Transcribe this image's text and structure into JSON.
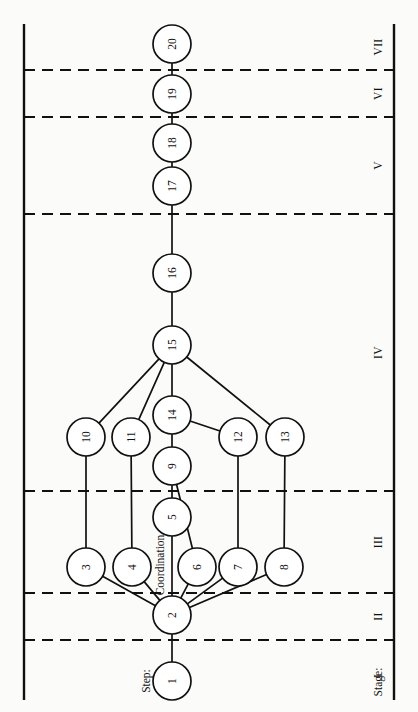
{
  "figure": {
    "orientation": "rotated-90-ccw",
    "background_color": "#fbfbf9",
    "ink_color": "#111111"
  },
  "axes": {
    "step_caption": "Step:",
    "stage_caption": "Stage:"
  },
  "stages": [
    {
      "id": "I",
      "label": "I",
      "band_start": 640,
      "band_end": 712
    },
    {
      "id": "II",
      "label": "II",
      "band_start": 593,
      "band_end": 640
    },
    {
      "id": "III",
      "label": "III",
      "band_start": 491,
      "band_end": 593
    },
    {
      "id": "IV",
      "label": "IV",
      "band_start": 214,
      "band_end": 491
    },
    {
      "id": "V",
      "label": "V",
      "band_start": 117,
      "band_end": 214
    },
    {
      "id": "VI",
      "label": "VI",
      "band_start": 70,
      "band_end": 117
    },
    {
      "id": "VII",
      "label": "VII",
      "band_start": 24,
      "band_end": 70
    }
  ],
  "dividers": [
    70,
    117,
    214,
    491,
    593,
    640
  ],
  "nodes": [
    {
      "id": 1,
      "label": "1",
      "x": 172,
      "y": 681,
      "r": 19,
      "stage": "I"
    },
    {
      "id": 2,
      "label": "2",
      "x": 172,
      "y": 615,
      "r": 19,
      "stage": "II"
    },
    {
      "id": 3,
      "label": "3",
      "x": 86,
      "y": 567,
      "r": 19,
      "stage": "III"
    },
    {
      "id": 4,
      "label": "4",
      "x": 132,
      "y": 567,
      "r": 19,
      "stage": "III"
    },
    {
      "id": 5,
      "label": "5",
      "x": 172,
      "y": 517,
      "r": 19,
      "stage": "III"
    },
    {
      "id": 6,
      "label": "6",
      "x": 197,
      "y": 567,
      "r": 19,
      "stage": "III"
    },
    {
      "id": 7,
      "label": "7",
      "x": 238,
      "y": 567,
      "r": 19,
      "stage": "III"
    },
    {
      "id": 8,
      "label": "8",
      "x": 284,
      "y": 567,
      "r": 19,
      "stage": "III"
    },
    {
      "id": 9,
      "label": "9",
      "x": 172,
      "y": 466,
      "r": 19,
      "stage": "IV"
    },
    {
      "id": 10,
      "label": "10",
      "x": 86,
      "y": 437,
      "r": 19,
      "stage": "IV"
    },
    {
      "id": 11,
      "label": "11",
      "x": 131,
      "y": 437,
      "r": 19,
      "stage": "IV"
    },
    {
      "id": 12,
      "label": "12",
      "x": 238,
      "y": 437,
      "r": 19,
      "stage": "IV"
    },
    {
      "id": 13,
      "label": "13",
      "x": 285,
      "y": 437,
      "r": 19,
      "stage": "IV"
    },
    {
      "id": 14,
      "label": "14",
      "x": 172,
      "y": 415,
      "r": 19,
      "stage": "IV"
    },
    {
      "id": 15,
      "label": "15",
      "x": 172,
      "y": 345,
      "r": 19,
      "stage": "IV"
    },
    {
      "id": 16,
      "label": "16",
      "x": 172,
      "y": 273,
      "r": 19,
      "stage": "IV"
    },
    {
      "id": 17,
      "label": "17",
      "x": 172,
      "y": 186,
      "r": 19,
      "stage": "V"
    },
    {
      "id": 18,
      "label": "18",
      "x": 172,
      "y": 143,
      "r": 19,
      "stage": "V"
    },
    {
      "id": 19,
      "label": "19",
      "x": 172,
      "y": 94,
      "r": 19,
      "stage": "VI"
    },
    {
      "id": 20,
      "label": "20",
      "x": 172,
      "y": 44,
      "r": 19,
      "stage": "VII"
    }
  ],
  "edges": [
    {
      "from": 1,
      "to": 2
    },
    {
      "from": 2,
      "to": 3
    },
    {
      "from": 2,
      "to": 4
    },
    {
      "from": 2,
      "to": 5
    },
    {
      "from": 2,
      "to": 6
    },
    {
      "from": 2,
      "to": 7
    },
    {
      "from": 2,
      "to": 8
    },
    {
      "from": 3,
      "to": 10
    },
    {
      "from": 4,
      "to": 11
    },
    {
      "from": 5,
      "to": 9
    },
    {
      "from": 6,
      "to": 9
    },
    {
      "from": 7,
      "to": 12
    },
    {
      "from": 8,
      "to": 13
    },
    {
      "from": 9,
      "to": 14
    },
    {
      "from": 10,
      "to": 15
    },
    {
      "from": 11,
      "to": 15
    },
    {
      "from": 12,
      "to": 14
    },
    {
      "from": 13,
      "to": 15
    },
    {
      "from": 14,
      "to": 15
    },
    {
      "from": 15,
      "to": 16
    },
    {
      "from": 16,
      "to": 17
    },
    {
      "from": 17,
      "to": 18
    },
    {
      "from": 18,
      "to": 19
    },
    {
      "from": 19,
      "to": 20
    }
  ],
  "annotations": [
    {
      "id": "coordination",
      "text": "Coordination",
      "on_edge": "2-5",
      "x": 160,
      "y": 565
    }
  ],
  "axis_geometry": {
    "left_axis_x": 24,
    "right_axis_x": 394,
    "axis_top": 24,
    "axis_bottom": 700,
    "divider_x_start": 24,
    "divider_x_end": 394,
    "stage_label_x": 378,
    "stage_caption_x": 378,
    "stage_caption_y": 682,
    "step_caption_x": 146,
    "step_caption_y": 681
  }
}
